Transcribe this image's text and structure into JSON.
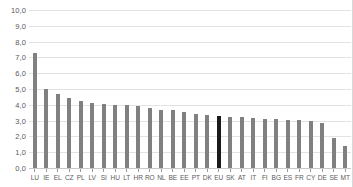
{
  "chart_data": {
    "type": "bar",
    "title": "",
    "xlabel": "",
    "ylabel": "",
    "ylim": [
      0,
      10
    ],
    "grid": true,
    "legend": "none",
    "decimal_separator": ",",
    "ytick_labels": [
      "10,0",
      "9,0",
      "8,0",
      "7,0",
      "6,0",
      "5,0",
      "4,0",
      "3,0",
      "2,0",
      "1,0",
      "0,0"
    ],
    "ytick_values": [
      10,
      9,
      8,
      7,
      6,
      5,
      4,
      3,
      2,
      1,
      0
    ],
    "highlight_category": "EU",
    "colors": {
      "bar": "#808080",
      "bar_highlight": "#1a1a1a",
      "gridline": "#e3e3e3",
      "axis": "#c9c9c9",
      "background": "#ffffff",
      "tick_text": "#5a5a5a"
    },
    "categories": [
      "LU",
      "IE",
      "EL",
      "CZ",
      "PL",
      "LV",
      "SI",
      "HU",
      "LT",
      "HR",
      "RO",
      "NL",
      "BE",
      "EE",
      "PT",
      "DK",
      "EU",
      "SK",
      "AT",
      "IT",
      "FI",
      "BG",
      "ES",
      "FR",
      "CY",
      "DE",
      "SE",
      "MT"
    ],
    "values": [
      7.3,
      5.0,
      4.7,
      4.4,
      4.25,
      4.1,
      4.05,
      4.0,
      3.98,
      3.9,
      3.8,
      3.67,
      3.65,
      3.55,
      3.4,
      3.35,
      3.3,
      3.25,
      3.2,
      3.18,
      3.1,
      3.1,
      3.07,
      3.05,
      3.0,
      2.87,
      1.9,
      1.4
    ]
  }
}
